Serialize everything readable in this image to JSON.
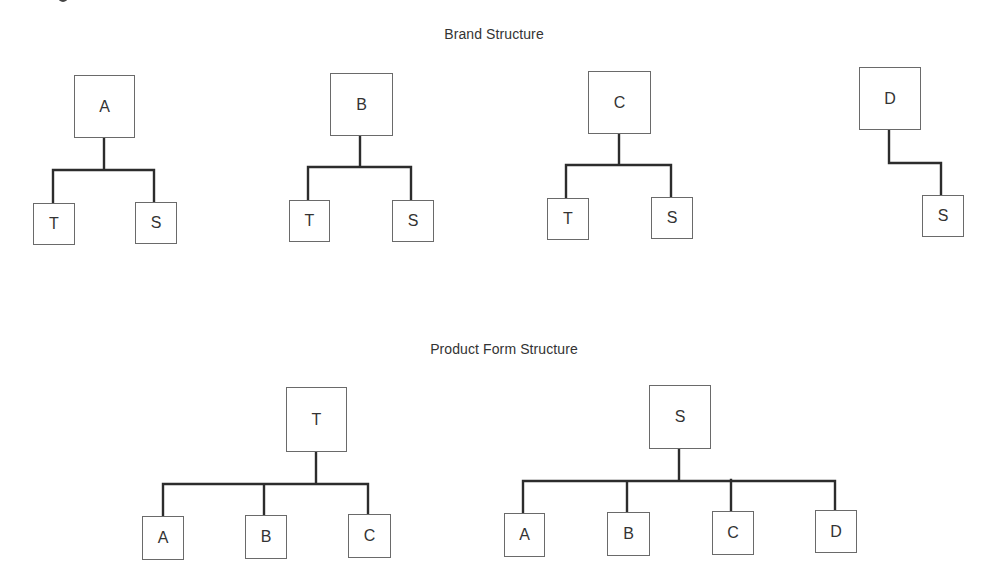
{
  "sections": {
    "brand": {
      "title": "Brand Structure",
      "trees": [
        {
          "root": "A",
          "children": [
            "T",
            "S"
          ]
        },
        {
          "root": "B",
          "children": [
            "T",
            "S"
          ]
        },
        {
          "root": "C",
          "children": [
            "T",
            "S"
          ]
        },
        {
          "root": "D",
          "children": [
            "S"
          ]
        }
      ]
    },
    "product_form": {
      "title": "Product Form Structure",
      "trees": [
        {
          "root": "T",
          "children": [
            "A",
            "B",
            "C"
          ]
        },
        {
          "root": "S",
          "children": [
            "A",
            "B",
            "C",
            "D"
          ]
        }
      ]
    }
  }
}
